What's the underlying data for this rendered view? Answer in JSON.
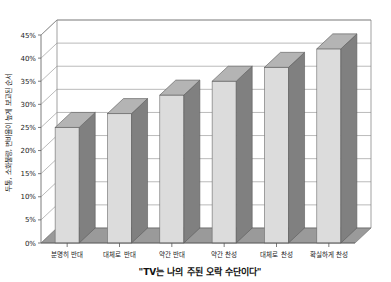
{
  "chart_data": {
    "type": "bar",
    "title": "",
    "subtitle": "\"TV는 나의 주된 오락 수단이다\"",
    "xlabel": "\"TV는 나의 주된 오락 수단이다\"",
    "ylabel": "두통, 소화불량, 변비율이 높게 보고된 순서",
    "categories": [
      "분명히 반대",
      "대체로 반대",
      "약간 반대",
      "약간 찬성",
      "대체로 찬성",
      "확실하게 찬성"
    ],
    "values": [
      25,
      28,
      32,
      35,
      38,
      42
    ],
    "value_labels": [
      "25%",
      "28%",
      "32%",
      "35%",
      "38%",
      "42%"
    ],
    "ylim": [
      0,
      45
    ],
    "ytick_values": [
      0,
      5,
      10,
      15,
      20,
      25,
      30,
      35,
      40,
      45
    ],
    "ytick_labels": [
      "0%",
      "5%",
      "10%",
      "15%",
      "20%",
      "25%",
      "30%",
      "35%",
      "40%",
      "45%"
    ],
    "grid": true,
    "legend": false,
    "legend_position": "none",
    "projection": "3d",
    "colors": {
      "bar_front": "#dcdcdc",
      "bar_side": "#808080",
      "bar_top": "#b4b4b4",
      "floor": "#9a9a9a",
      "wall": "#ffffff",
      "gridline": "#8c8c8c",
      "axis": "#5a5a5a",
      "text": "#1a1a1a",
      "background": "#ffffff"
    }
  }
}
